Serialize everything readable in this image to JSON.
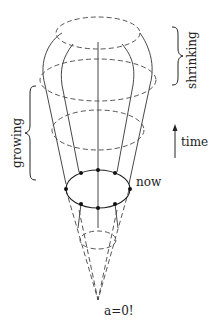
{
  "diagram": {
    "type": "expanding-universe-cone",
    "labels": {
      "shrinking": "shrinking",
      "growing": "growing",
      "time": "time",
      "now": "now",
      "origin": "a=0!"
    },
    "colors": {
      "line": "#333333",
      "dashed": "#444444",
      "dot": "#111111",
      "background": "#ffffff"
    }
  }
}
